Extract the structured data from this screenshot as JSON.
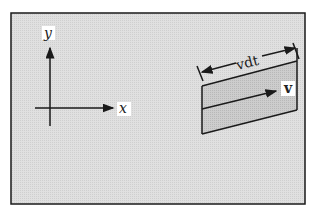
{
  "diagram": {
    "axes": {
      "x_label": "x",
      "y_label": "y"
    },
    "slab": {
      "width_label": "vdt",
      "velocity_label": "v"
    },
    "colors": {
      "background": "#d9d9d9",
      "slab_fill": "#c4c4c4",
      "ink": "#1a1a1a"
    }
  }
}
